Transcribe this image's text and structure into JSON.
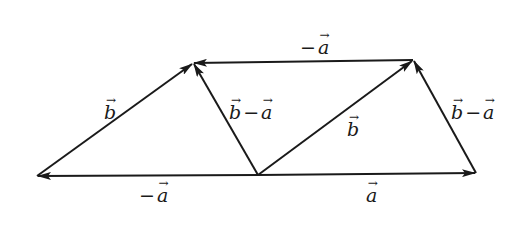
{
  "diagram": {
    "type": "vector-diagram",
    "stroke_color": "#1a1a1a",
    "background": "#ffffff",
    "points": {
      "L": {
        "x": 37,
        "y": 176
      },
      "TL": {
        "x": 193,
        "y": 63
      },
      "TR": {
        "x": 413,
        "y": 60
      },
      "R": {
        "x": 476,
        "y": 173
      },
      "M": {
        "x": 258,
        "y": 175
      }
    },
    "vectors": [
      {
        "id": "v1",
        "from": "L",
        "to": "TL",
        "label": "b"
      },
      {
        "id": "v2",
        "from": "M",
        "to": "L",
        "label": "-a"
      },
      {
        "id": "v3",
        "from": "M",
        "to": "TL",
        "label": "b-a"
      },
      {
        "id": "v4",
        "from": "TR",
        "to": "TL",
        "label": "-a"
      },
      {
        "id": "v5",
        "from": "M",
        "to": "TR",
        "label": "b"
      },
      {
        "id": "v6",
        "from": "M",
        "to": "R",
        "label": "a"
      },
      {
        "id": "v7",
        "from": "R",
        "to": "TR",
        "label": "b-a"
      }
    ],
    "labels": {
      "left_b": {
        "sym": "b"
      },
      "mid_left_b_minus_a": {
        "sym1": "b",
        "op": "−",
        "sym2": "a"
      },
      "top_minus_a": {
        "op": "−",
        "sym": "a"
      },
      "center_b": {
        "sym": "b"
      },
      "right_b_minus_a": {
        "sym1": "b",
        "op": "−",
        "sym2": "a"
      },
      "bottom_left_minus_a": {
        "op": "−",
        "sym": "a"
      },
      "bottom_right_a": {
        "sym": "a"
      },
      "arrow_glyph": "→"
    }
  }
}
